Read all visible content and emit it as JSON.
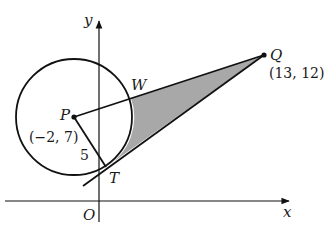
{
  "diagram": {
    "axes": {
      "x_label": "x",
      "y_label": "y",
      "origin_label": "O"
    },
    "points": {
      "P": {
        "label": "P",
        "coords": "(−2, 7)"
      },
      "Q": {
        "label": "Q",
        "coords": "(13, 12)"
      },
      "T": {
        "label": "T"
      },
      "W": {
        "label": "W"
      }
    },
    "radius_label": "5",
    "colors": {
      "line": "#111111",
      "shade": "#a8a8a8",
      "background": "#ffffff"
    }
  }
}
